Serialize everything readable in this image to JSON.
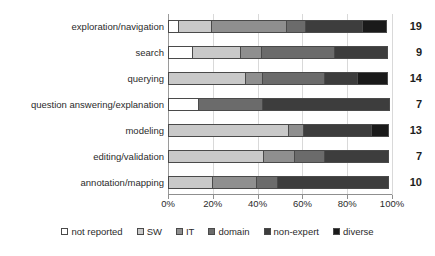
{
  "chart_data": {
    "type": "bar",
    "orientation": "horizontal",
    "stacked": true,
    "normalized_percent": true,
    "title": "",
    "subtitle": "",
    "xlabel": "",
    "ylabel": "",
    "xlim": [
      0,
      100
    ],
    "xticks": [
      0,
      20,
      40,
      60,
      80,
      100
    ],
    "xtick_labels": [
      "0%",
      "20%",
      "40%",
      "60%",
      "80%",
      "100%"
    ],
    "grid": true,
    "grid_axis": "x",
    "legend_position": "bottom",
    "categories": [
      "exploration/navigation",
      "search",
      "querying",
      "question answering/explanation",
      "modeling",
      "editing/validation",
      "annotation/mapping"
    ],
    "series": [
      {
        "name": "not reported",
        "color": "#ffffff",
        "values": [
          5,
          11,
          0,
          14,
          0,
          0,
          0
        ]
      },
      {
        "name": "SW",
        "color": "#c9c9c9",
        "values": [
          15,
          22,
          35,
          0,
          54,
          43,
          20
        ]
      },
      {
        "name": "IT",
        "color": "#8f8f8f",
        "values": [
          34,
          10,
          8,
          0,
          7,
          14,
          20
        ]
      },
      {
        "name": "domain",
        "color": "#6b6b6b",
        "values": [
          9,
          33,
          28,
          29,
          0,
          14,
          10
        ]
      },
      {
        "name": "non-expert",
        "color": "#3d3d3d",
        "values": [
          26,
          24,
          15,
          57,
          31,
          29,
          50
        ]
      },
      {
        "name": "diverse",
        "color": "#1a1a1a",
        "values": [
          11,
          0,
          14,
          0,
          8,
          0,
          0
        ]
      }
    ],
    "value_labels": [
      19,
      9,
      14,
      7,
      13,
      7,
      10
    ],
    "value_label_note": "count shown at right end of each bar"
  },
  "legend": {
    "items": [
      {
        "label": "not reported",
        "swatch": "#ffffff"
      },
      {
        "label": "SW",
        "swatch": "#c9c9c9"
      },
      {
        "label": "IT",
        "swatch": "#8f8f8f"
      },
      {
        "label": "domain",
        "swatch": "#6b6b6b"
      },
      {
        "label": "non-expert",
        "swatch": "#3d3d3d"
      },
      {
        "label": "diverse",
        "swatch": "#1a1a1a"
      }
    ]
  },
  "colors": {
    "grid": "#d9d9d9",
    "axis": "#8f8f8f",
    "segment_border": "#4a4a4a",
    "text": "#2b2b2b",
    "value_text": "#1d1d1d",
    "background": "#ffffff"
  }
}
